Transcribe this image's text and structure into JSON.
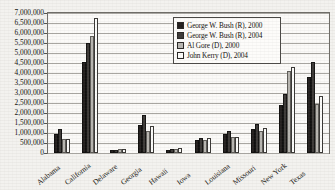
{
  "chart_data": {
    "type": "bar",
    "title": "",
    "xlabel": "",
    "ylabel": "",
    "ylim": [
      0,
      7000000
    ],
    "ytick_step": 500000,
    "grid": true,
    "legend_position": "top-right-inside",
    "ytick_labels": [
      "7,000,000",
      "6,500,000",
      "6,000,000",
      "5,500,000",
      "5,000,000",
      "4,500,000",
      "4,000,000",
      "3,500,000",
      "3,000,000",
      "2,500,000",
      "2,000,000",
      "1,500,000",
      "1,000,000",
      "500,000",
      "0"
    ],
    "categories": [
      "Alabama",
      "California",
      "Delaware",
      "Georgia",
      "Hawaii",
      "Iowa",
      "Louisiana",
      "Missouri",
      "New York",
      "Texas"
    ],
    "series": [
      {
        "name": "George W. Bush (R), 2000",
        "color": "#231f1e",
        "values": [
          941173,
          4567429,
          137288,
          1419720,
          137845,
          634373,
          927871,
          1189924,
          2403374,
          3799639
        ]
      },
      {
        "name": "George W. Bush (R), 2004",
        "color": "#3d3a38",
        "values": [
          1176394,
          5509826,
          171660,
          1914254,
          194191,
          751957,
          1102169,
          1455713,
          2962567,
          4526917
        ]
      },
      {
        "name": "Al Gore (D), 2000",
        "color": "#b9b7b2",
        "values": [
          692611,
          5861203,
          180068,
          1116230,
          205286,
          638517,
          792344,
          1111138,
          4107697,
          2433746
        ]
      },
      {
        "name": "John Kerry (D), 2004",
        "color": "#fdfdfb",
        "values": [
          693933,
          6745485,
          200152,
          1366149,
          231708,
          741898,
          820299,
          1259171,
          4314280,
          2832704
        ]
      }
    ]
  },
  "legend": {
    "items": [
      {
        "label": "George W. Bush (R), 2000"
      },
      {
        "label": "George W. Bush (R), 2004"
      },
      {
        "label": "Al Gore (D), 2000"
      },
      {
        "label": "John Kerry (D), 2004"
      }
    ]
  }
}
